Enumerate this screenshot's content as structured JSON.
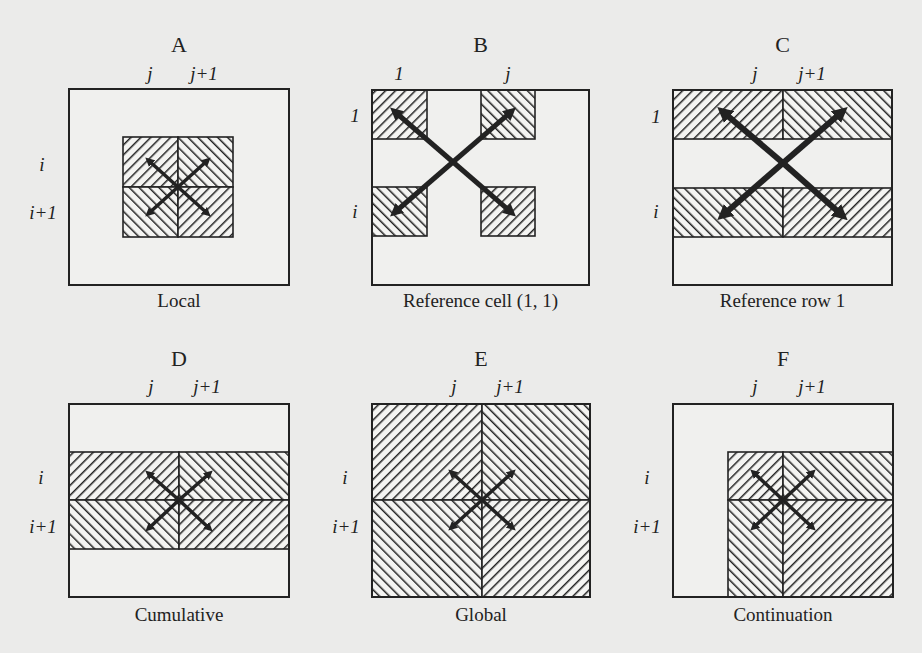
{
  "figure": {
    "background": "#ebebea",
    "ink": "#222222",
    "panels": [
      {
        "id": "A",
        "letter": "A",
        "caption": "Local",
        "box": [
          69,
          89,
          220,
          196
        ],
        "col_labels": [
          {
            "text": "j",
            "x": 150,
            "y": 80
          },
          {
            "text": "j+1",
            "x": 204,
            "y": 80
          }
        ],
        "row_labels": [
          {
            "text": "i",
            "x": 42,
            "y": 171
          },
          {
            "text": "i+1",
            "x": 43,
            "y": 219
          }
        ],
        "hatched": [
          {
            "x": 123,
            "y": 137,
            "w": 55,
            "h": 50,
            "dir": "back"
          },
          {
            "x": 178,
            "y": 137,
            "w": 55,
            "h": 50,
            "dir": "fwd"
          },
          {
            "x": 123,
            "y": 187,
            "w": 55,
            "h": 50,
            "dir": "fwd"
          },
          {
            "x": 178,
            "y": 187,
            "w": 55,
            "h": 50,
            "dir": "back"
          }
        ],
        "arrows": {
          "cx": 178,
          "cy": 187,
          "tips": [
            [
              148,
              160
            ],
            [
              208,
              160
            ],
            [
              148,
              214
            ],
            [
              208,
              214
            ]
          ],
          "width": 3.5
        }
      },
      {
        "id": "B",
        "letter": "B",
        "caption": "Reference cell (1, 1)",
        "box": [
          372,
          90,
          217,
          195
        ],
        "col_labels": [
          {
            "text": "1",
            "x": 399,
            "y": 80
          },
          {
            "text": "j",
            "x": 508,
            "y": 80
          }
        ],
        "row_labels": [
          {
            "text": "1",
            "x": 355,
            "y": 122
          },
          {
            "text": "i",
            "x": 355,
            "y": 218
          }
        ],
        "hatched": [
          {
            "x": 372,
            "y": 90,
            "w": 55,
            "h": 49,
            "dir": "back"
          },
          {
            "x": 481,
            "y": 90,
            "w": 54,
            "h": 49,
            "dir": "fwd"
          },
          {
            "x": 372,
            "y": 187,
            "w": 55,
            "h": 49,
            "dir": "fwd"
          },
          {
            "x": 481,
            "y": 187,
            "w": 54,
            "h": 49,
            "dir": "back"
          }
        ],
        "arrows": {
          "cx": 453,
          "cy": 162,
          "tips": [
            [
              394,
              111
            ],
            [
              512,
              111
            ],
            [
              394,
              213
            ],
            [
              512,
              213
            ]
          ],
          "width": 5
        }
      },
      {
        "id": "C",
        "letter": "C",
        "caption": "Reference row 1",
        "box": [
          673,
          90,
          219,
          195
        ],
        "col_labels": [
          {
            "text": "j",
            "x": 755,
            "y": 80
          },
          {
            "text": "j+1",
            "x": 812,
            "y": 80
          }
        ],
        "row_labels": [
          {
            "text": "1",
            "x": 656,
            "y": 123
          },
          {
            "text": "i",
            "x": 656,
            "y": 218
          }
        ],
        "hatched": [
          {
            "x": 673,
            "y": 90,
            "w": 110,
            "h": 49,
            "dir": "back"
          },
          {
            "x": 783,
            "y": 90,
            "w": 109,
            "h": 49,
            "dir": "fwd"
          },
          {
            "x": 673,
            "y": 188,
            "w": 110,
            "h": 49,
            "dir": "fwd"
          },
          {
            "x": 783,
            "y": 188,
            "w": 109,
            "h": 49,
            "dir": "back"
          }
        ],
        "arrows": {
          "cx": 783,
          "cy": 163,
          "tips": [
            [
              722,
              111
            ],
            [
              843,
              111
            ],
            [
              722,
              216
            ],
            [
              843,
              216
            ]
          ],
          "width": 6
        }
      },
      {
        "id": "D",
        "letter": "D",
        "caption": "Cumulative",
        "box": [
          69,
          404,
          220,
          193
        ],
        "col_labels": [
          {
            "text": "j",
            "x": 151,
            "y": 393
          },
          {
            "text": "j+1",
            "x": 207,
            "y": 393
          }
        ],
        "row_labels": [
          {
            "text": "i",
            "x": 41,
            "y": 484
          },
          {
            "text": "i+1",
            "x": 43,
            "y": 533
          }
        ],
        "hatched": [
          {
            "x": 69,
            "y": 452,
            "w": 110,
            "h": 48,
            "dir": "back"
          },
          {
            "x": 179,
            "y": 452,
            "w": 110,
            "h": 48,
            "dir": "fwd"
          },
          {
            "x": 69,
            "y": 500,
            "w": 110,
            "h": 49,
            "dir": "fwd"
          },
          {
            "x": 179,
            "y": 500,
            "w": 110,
            "h": 49,
            "dir": "back"
          }
        ],
        "arrows": {
          "cx": 179,
          "cy": 500,
          "tips": [
            [
              148,
              473
            ],
            [
              210,
              473
            ],
            [
              148,
              529
            ],
            [
              210,
              529
            ]
          ],
          "width": 3.5
        }
      },
      {
        "id": "E",
        "letter": "E",
        "caption": "Global",
        "box": [
          372,
          404,
          218,
          193
        ],
        "col_labels": [
          {
            "text": "j",
            "x": 454,
            "y": 393
          },
          {
            "text": "j+1",
            "x": 510,
            "y": 393
          }
        ],
        "row_labels": [
          {
            "text": "i",
            "x": 345,
            "y": 484
          },
          {
            "text": "i+1",
            "x": 346,
            "y": 533
          }
        ],
        "hatched": [
          {
            "x": 372,
            "y": 404,
            "w": 110,
            "h": 96,
            "dir": "back"
          },
          {
            "x": 482,
            "y": 404,
            "w": 108,
            "h": 96,
            "dir": "fwd"
          },
          {
            "x": 372,
            "y": 500,
            "w": 110,
            "h": 97,
            "dir": "fwd"
          },
          {
            "x": 482,
            "y": 500,
            "w": 108,
            "h": 97,
            "dir": "back"
          }
        ],
        "arrows": {
          "cx": 482,
          "cy": 500,
          "tips": [
            [
              451,
              472
            ],
            [
              513,
              472
            ],
            [
              451,
              528
            ],
            [
              513,
              528
            ]
          ],
          "width": 3.5
        }
      },
      {
        "id": "F",
        "letter": "F",
        "caption": "Continuation",
        "box": [
          673,
          404,
          220,
          193
        ],
        "col_labels": [
          {
            "text": "j",
            "x": 755,
            "y": 393
          },
          {
            "text": "j+1",
            "x": 812,
            "y": 393
          }
        ],
        "row_labels": [
          {
            "text": "i",
            "x": 647,
            "y": 484
          },
          {
            "text": "i+1",
            "x": 647,
            "y": 533
          }
        ],
        "hatched": [
          {
            "x": 728,
            "y": 452,
            "w": 55,
            "h": 48,
            "dir": "back"
          },
          {
            "x": 783,
            "y": 452,
            "w": 110,
            "h": 48,
            "dir": "fwd"
          },
          {
            "x": 728,
            "y": 500,
            "w": 55,
            "h": 97,
            "dir": "fwd"
          },
          {
            "x": 783,
            "y": 500,
            "w": 110,
            "h": 97,
            "dir": "back"
          }
        ],
        "arrows": {
          "cx": 783,
          "cy": 500,
          "tips": [
            [
              753,
              472
            ],
            [
              813,
              472
            ],
            [
              753,
              528
            ],
            [
              813,
              528
            ]
          ],
          "width": 3.5
        }
      }
    ],
    "letter_y": [
      52,
      366
    ],
    "caption_y": [
      307,
      621
    ]
  }
}
